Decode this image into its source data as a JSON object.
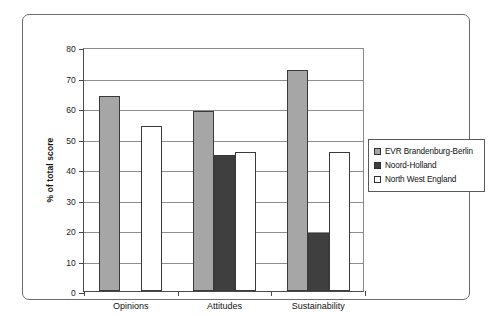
{
  "chart_data": {
    "type": "bar",
    "title": "",
    "xlabel": "",
    "ylabel": "% of total score",
    "ylim": [
      0,
      80
    ],
    "ytick_step": 10,
    "yticks": [
      0,
      10,
      20,
      30,
      40,
      50,
      60,
      70,
      80
    ],
    "grid": true,
    "legend_position": "right",
    "categories": [
      "Opinions",
      "Attitudes",
      "Sustainability"
    ],
    "series": [
      {
        "name": "EVR Brandenburg-Berlin",
        "color": "#a6a6a6",
        "values": [
          64,
          59,
          72.5
        ]
      },
      {
        "name": "Noord-Holland",
        "color": "#3f3f3f",
        "values": [
          0,
          44.5,
          19
        ]
      },
      {
        "name": "North West England",
        "color": "#ffffff",
        "values": [
          54,
          45.5,
          45.5
        ]
      }
    ]
  },
  "legend": {
    "items": [
      {
        "label": "EVR Brandenburg-Berlin",
        "swatch": "series-0-swatch"
      },
      {
        "label": "Noord-Holland",
        "swatch": "series-1-swatch"
      },
      {
        "label": "North West England",
        "swatch": "series-2-swatch"
      }
    ]
  },
  "axes": {
    "y_title": "% of total score",
    "y_labels": [
      "80",
      "70",
      "60",
      "50",
      "40",
      "30",
      "20",
      "10",
      "0"
    ],
    "x_labels": [
      "Opinions",
      "Attitudes",
      "Sustainability"
    ]
  }
}
